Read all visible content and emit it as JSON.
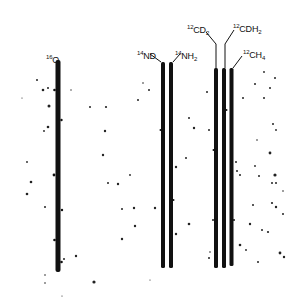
{
  "figure": {
    "type": "mass spectrum photographic plate (spectral lines)",
    "ink_color": "#111111",
    "background": "#ffffff",
    "lines": [
      {
        "id": "o16",
        "mass_label": "16",
        "species": "O",
        "subscript": "",
        "x": 58,
        "top": 60,
        "bottom": 272,
        "width": 4.5
      },
      {
        "id": "nd14",
        "mass_label": "14",
        "species": "ND",
        "subscript": "",
        "x": 163,
        "top": 62,
        "bottom": 268,
        "width": 3.5
      },
      {
        "id": "nh2_14",
        "mass_label": "14",
        "species": "NH",
        "subscript": "2",
        "x": 171,
        "top": 62,
        "bottom": 268,
        "width": 3.5
      },
      {
        "id": "cd2_12",
        "mass_label": "12",
        "species": "CD",
        "subscript": "2",
        "x": 216,
        "top": 68,
        "bottom": 268,
        "width": 3.5
      },
      {
        "id": "cdh2_12",
        "mass_label": "12",
        "species": "CDH",
        "subscript": "2",
        "x": 224,
        "top": 68,
        "bottom": 268,
        "width": 3.5
      },
      {
        "id": "ch4_12",
        "mass_label": "12",
        "species": "CH",
        "subscript": "4",
        "x": 231,
        "top": 68,
        "bottom": 268,
        "width": 3.5
      }
    ],
    "labels": {
      "o16": {
        "sup": "16",
        "text": "O",
        "sub": ""
      },
      "nd14": {
        "sup": "14",
        "text": "ND",
        "sub": ""
      },
      "nh2_14": {
        "sup": "14",
        "text": "NH",
        "sub": "2"
      },
      "cd2_12": {
        "sup": "12",
        "text": "CD",
        "sub": "2"
      },
      "cdh2_12": {
        "sup": "12",
        "text": "CDH",
        "sub": "2"
      },
      "ch4_12": {
        "sup": "12",
        "text": "CH",
        "sub": "4"
      }
    }
  }
}
